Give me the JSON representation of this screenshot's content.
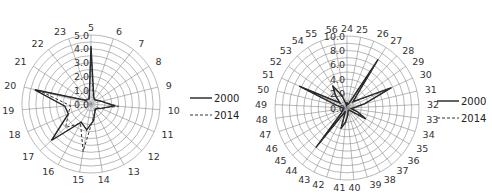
{
  "chart_data": [
    {
      "type": "radar",
      "title": "",
      "categories": [
        "5",
        "6",
        "7",
        "8",
        "9",
        "10",
        "11",
        "12",
        "13",
        "14",
        "15",
        "16",
        "17",
        "18",
        "19",
        "20",
        "21",
        "22",
        "23"
      ],
      "series": [
        {
          "name": "2000",
          "style": "solid",
          "values": [
            4.2,
            0.6,
            0.4,
            0.5,
            0.8,
            1.7,
            0.8,
            0.5,
            0.6,
            1.2,
            1.9,
            1.5,
            3.9,
            1.8,
            1.9,
            4.2,
            0.5,
            0.4,
            0.4
          ]
        },
        {
          "name": "2014",
          "style": "dashed",
          "values": [
            4.0,
            0.5,
            0.4,
            0.5,
            0.8,
            2.0,
            0.8,
            0.4,
            0.6,
            1.0,
            3.5,
            1.6,
            2.5,
            1.8,
            1.5,
            3.8,
            0.5,
            0.4,
            0.4
          ]
        }
      ],
      "rlim": [
        0,
        5
      ],
      "tick_labels": [
        "0.0",
        "1.0",
        "2.0",
        "3.0",
        "4.0",
        "5.0"
      ],
      "tick_values": [
        0,
        1,
        2,
        3,
        4,
        5
      ],
      "grid_rings": 10,
      "legend": [
        "2000",
        "2014"
      ],
      "legend_position": "right"
    },
    {
      "type": "radar",
      "title": "",
      "categories": [
        "24",
        "25",
        "26",
        "27",
        "28",
        "29",
        "30",
        "31",
        "32",
        "33",
        "34",
        "35",
        "36",
        "37",
        "38",
        "39",
        "40",
        "41",
        "42",
        "43",
        "44",
        "45",
        "46",
        "47",
        "48",
        "49",
        "50",
        "51",
        "52",
        "53",
        "54",
        "55",
        "56"
      ],
      "series": [
        {
          "name": "2000",
          "style": "solid",
          "values": [
            0.8,
            0.5,
            0.6,
            8.0,
            1.2,
            2.0,
            6.8,
            2.5,
            1.0,
            0.6,
            1.5,
            3.0,
            0.5,
            0.4,
            0.4,
            0.5,
            1.0,
            2.0,
            3.0,
            0.5,
            7.0,
            1.0,
            0.8,
            0.6,
            0.5,
            0.6,
            1.4,
            7.3,
            1.2,
            2.3,
            3.7,
            1.8,
            0.4
          ]
        },
        {
          "name": "2014",
          "style": "dashed",
          "values": [
            0.7,
            0.5,
            0.6,
            7.6,
            1.1,
            1.9,
            6.5,
            2.4,
            1.0,
            0.6,
            1.4,
            2.8,
            0.5,
            0.4,
            0.4,
            0.5,
            1.0,
            1.8,
            2.8,
            0.5,
            6.6,
            1.0,
            0.8,
            0.6,
            0.5,
            0.6,
            1.3,
            7.0,
            1.1,
            2.1,
            3.5,
            1.7,
            0.4
          ]
        }
      ],
      "rlim": [
        0,
        10
      ],
      "tick_labels": [
        "0.0",
        "2.0",
        "4.0",
        "6.0",
        "8.0",
        "10.0"
      ],
      "tick_values": [
        0,
        2,
        4,
        6,
        8,
        10
      ],
      "grid_rings": 10,
      "legend": [
        "2000",
        "2014"
      ],
      "legend_position": "right"
    }
  ],
  "layout": {
    "charts": [
      {
        "cx": 91,
        "cy": 104,
        "r": 69,
        "legend_x": 190,
        "legend_y": 98
      },
      {
        "cx": 101,
        "cy": 108,
        "r": 72,
        "legend_x": 191,
        "legend_y": 101
      }
    ]
  }
}
